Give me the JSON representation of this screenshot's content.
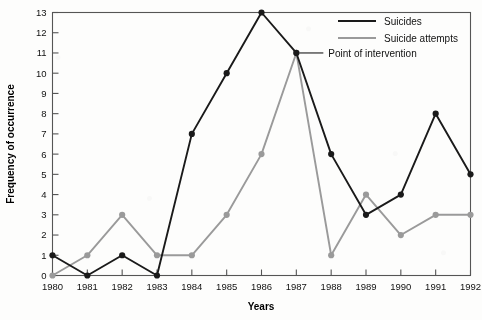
{
  "chart_data": {
    "type": "line",
    "title": "",
    "xlabel": "Years",
    "ylabel": "Frequency of occurrence",
    "categories": [
      1980,
      1981,
      1982,
      1983,
      1984,
      1985,
      1986,
      1987,
      1988,
      1989,
      1990,
      1991,
      1992
    ],
    "xtick_labels": [
      "1980",
      "1981",
      "1982",
      "1983",
      "1984",
      "1985",
      "1986",
      "1987",
      "1988",
      "1989",
      "1990",
      "1991",
      "1992"
    ],
    "ytick_labels": [
      "0",
      "1",
      "2",
      "3",
      "4",
      "5",
      "6",
      "7",
      "8",
      "9",
      "10",
      "11",
      "12",
      "13"
    ],
    "ylim": [
      0,
      13
    ],
    "xlim": [
      1980,
      1992
    ],
    "grid": false,
    "legend_position": "top-right",
    "series": [
      {
        "name": "Suicides",
        "color": "#1a1a1a",
        "values": [
          1,
          0,
          1,
          0,
          7,
          10,
          13,
          11,
          6,
          3,
          4,
          8,
          5
        ]
      },
      {
        "name": "Suicide attempts",
        "color": "#9a9a9a",
        "values": [
          0,
          1,
          3,
          1,
          1,
          3,
          6,
          11,
          1,
          4,
          2,
          3,
          3
        ]
      }
    ],
    "annotations": [
      {
        "text": "Point of intervention",
        "target_x": 1987,
        "target_y": 11
      }
    ]
  }
}
